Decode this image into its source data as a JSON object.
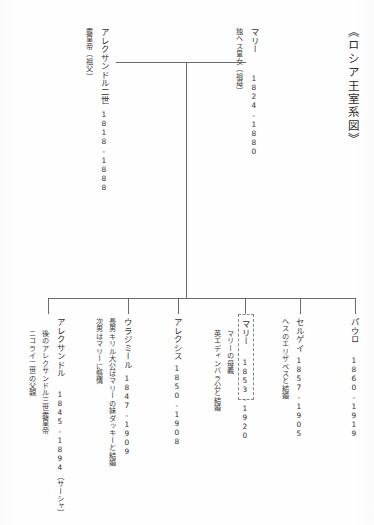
{
  "document": {
    "title": "《ロシア王室系図》",
    "orientation": "vertical-japanese",
    "line_color": "#6e6c6a",
    "text_color": "#33312f",
    "highlight_border_color": "#8a8886"
  },
  "parents": {
    "father": {
      "name": "アレクサンドル二世",
      "role": "露皇帝（祖父）",
      "dates": "1818-1888"
    },
    "mother": {
      "name": "マリー",
      "role": "独ヘス皇女（祖母）",
      "dates": "1824-1880"
    }
  },
  "children": [
    {
      "name": "アレクサンドル",
      "dates": "1845-1894（サーシャ）",
      "notes": [
        "後のアレクサンドル三世露皇帝",
        "ニコライ二世の父親"
      ],
      "highlighted": false
    },
    {
      "name": "ウラジミール",
      "dates": "1847-1909",
      "notes": [
        "長男キリル大公はマリーの妹ダッキーと結婚",
        "次男はマリーに懸情"
      ],
      "highlighted": false
    },
    {
      "name": "アレクシス",
      "dates": "1850-1908",
      "notes": [],
      "highlighted": false
    },
    {
      "name": "マリー",
      "dates": "1853-1920",
      "notes": [
        "マリーの母義",
        "英エディンバラ公と結婚"
      ],
      "highlighted": true
    },
    {
      "name": "セルゲイ",
      "dates": "1857-1905",
      "notes": [
        "ヘスのエリザベスと結婚"
      ],
      "highlighted": false
    },
    {
      "name": "パウロ",
      "dates": "1860-1919",
      "notes": [],
      "highlighted": false
    }
  ]
}
